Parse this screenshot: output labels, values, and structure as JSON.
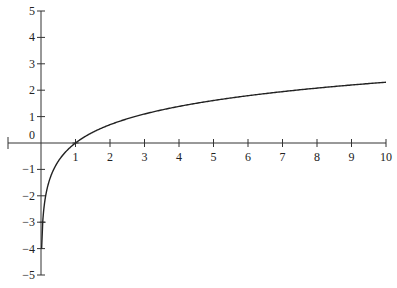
{
  "chart_data": {
    "type": "line",
    "title": "",
    "function": "y = ln(x)",
    "xlabel": "",
    "ylabel": "",
    "xlim": [
      -1,
      10
    ],
    "ylim": [
      -5,
      5
    ],
    "grid": false,
    "legend": null,
    "x_ticks": [
      1,
      2,
      3,
      4,
      5,
      6,
      7,
      8,
      9,
      10
    ],
    "x_tick_labels": [
      "1",
      "2",
      "3",
      "4",
      "5",
      "6",
      "7",
      "8",
      "9",
      "10"
    ],
    "y_ticks": [
      5,
      4,
      3,
      2,
      1,
      0,
      -1,
      -2,
      -3,
      -4,
      -5
    ],
    "y_tick_labels": [
      "5",
      "4",
      "3",
      "2",
      "1",
      "0",
      "-1",
      "-2",
      "-3",
      "-4",
      "-5"
    ],
    "series": [
      {
        "name": "ln(x)",
        "color": "#222222",
        "x": [
          0.05,
          0.1,
          0.2,
          0.3,
          0.5,
          0.75,
          1,
          1.5,
          2,
          3,
          4,
          5,
          6,
          7,
          8,
          9,
          10
        ],
        "y": [
          -3.0,
          -2.3,
          -1.61,
          -1.2,
          -0.69,
          -0.29,
          0,
          0.41,
          0.69,
          1.1,
          1.39,
          1.61,
          1.79,
          1.95,
          2.08,
          2.2,
          2.3
        ]
      }
    ],
    "marked_points": [
      {
        "x": 1,
        "y": 0
      },
      {
        "x": 0.05,
        "y": -3
      }
    ]
  }
}
